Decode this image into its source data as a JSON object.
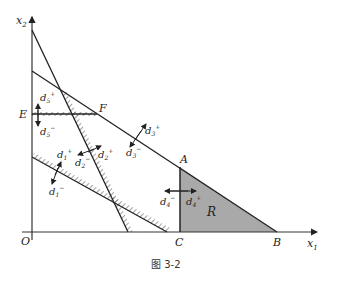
{
  "figure": {
    "caption": "图 3-2",
    "axes": {
      "x_label": "x",
      "x_sub": "1",
      "y_label": "x",
      "y_sub": "2",
      "origin": "O"
    },
    "points": {
      "A": "A",
      "B": "B",
      "C": "C",
      "E": "E",
      "F": "F"
    },
    "region_label": "R",
    "deviation_labels": {
      "d1p": "d",
      "d1p_sub": "1",
      "d1p_sup": "+",
      "d1m": "d",
      "d1m_sub": "1",
      "d1m_sup": "−",
      "d2p": "d",
      "d2p_sub": "2",
      "d2p_sup": "+",
      "d2m": "d",
      "d2m_sub": "2",
      "d2m_sup": "−",
      "d3p": "d",
      "d3p_sub": "3",
      "d3p_sup": "+",
      "d3m": "d",
      "d3m_sub": "3",
      "d3m_sup": "−",
      "d4p": "d",
      "d4p_sub": "4",
      "d4p_sup": "+",
      "d4m": "d",
      "d4m_sub": "4",
      "d4m_sup": "−",
      "d5p": "d",
      "d5p_sub": "5",
      "d5p_sup": "+",
      "d5m": "d",
      "d5m_sub": "5",
      "d5m_sup": "−"
    },
    "colors": {
      "line": "#222222",
      "region_fill": "#a9a9a9",
      "axis": "#333333"
    }
  }
}
